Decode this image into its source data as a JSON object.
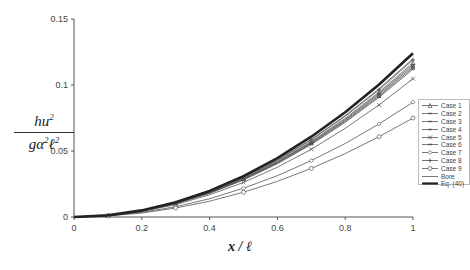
{
  "chart_data": {
    "type": "line",
    "title": "",
    "xlabel": "x / ℓ",
    "ylabel": "hu² / gα²ℓ²",
    "xlim": [
      0,
      1
    ],
    "ylim": [
      0,
      0.15
    ],
    "x_ticks": [
      "0",
      "0.2",
      "0.4",
      "0.6",
      "0.8",
      "1"
    ],
    "y_ticks": [
      "0",
      "0.05",
      "0.1",
      "0.15"
    ],
    "grid": false,
    "legend_position": "right",
    "x": [
      0,
      0.1,
      0.2,
      0.3,
      0.4,
      0.5,
      0.6,
      0.7,
      0.8,
      0.9,
      1.0
    ],
    "series": [
      {
        "name": "Case 1",
        "marker": "triangle",
        "values": [
          0,
          0.0012,
          0.0047,
          0.0105,
          0.0187,
          0.0292,
          0.042,
          0.0572,
          0.0747,
          0.0946,
          0.1168
        ]
      },
      {
        "name": "Case 2",
        "marker": "dash",
        "values": [
          0,
          0.0012,
          0.0046,
          0.0104,
          0.0185,
          0.0289,
          0.0416,
          0.0566,
          0.0739,
          0.0936,
          0.1155
        ]
      },
      {
        "name": "Case 3",
        "marker": "dash",
        "values": [
          0,
          0.0011,
          0.0046,
          0.0103,
          0.0183,
          0.0286,
          0.0412,
          0.056,
          0.0732,
          0.0926,
          0.1143
        ]
      },
      {
        "name": "Case 4",
        "marker": "dash",
        "values": [
          0,
          0.0011,
          0.0045,
          0.0102,
          0.0181,
          0.0283,
          0.0408,
          0.0555,
          0.0725,
          0.0917,
          0.1132
        ]
      },
      {
        "name": "Case 5",
        "marker": "x",
        "values": [
          0,
          0.001,
          0.0042,
          0.0094,
          0.0168,
          0.0262,
          0.0377,
          0.0513,
          0.0671,
          0.0849,
          0.1048
        ]
      },
      {
        "name": "Case 6",
        "marker": "dash",
        "values": [
          0,
          0.0011,
          0.0045,
          0.0101,
          0.0179,
          0.028,
          0.0403,
          0.0549,
          0.0717,
          0.0907,
          0.112
        ]
      },
      {
        "name": "Case 7",
        "marker": "diamond",
        "values": [
          0,
          0.0009,
          0.0035,
          0.0078,
          0.0139,
          0.0218,
          0.0313,
          0.0427,
          0.0557,
          0.0705,
          0.087
        ]
      },
      {
        "name": "Case 8",
        "marker": "plus",
        "values": [
          0,
          0.0012,
          0.0048,
          0.0107,
          0.019,
          0.0297,
          0.0428,
          0.0583,
          0.0762,
          0.0964,
          0.119
        ]
      },
      {
        "name": "Case 9",
        "marker": "circle",
        "values": [
          0,
          0.0008,
          0.003,
          0.0068,
          0.012,
          0.0188,
          0.027,
          0.0368,
          0.048,
          0.0608,
          0.075
        ]
      },
      {
        "name": "Bore",
        "marker": "none",
        "values": [
          0,
          0.0012,
          0.0048,
          0.0108,
          0.0192,
          0.03,
          0.0432,
          0.0588,
          0.0768,
          0.0972,
          0.12
        ]
      },
      {
        "name": "Eq. (40)",
        "marker": "none",
        "bold": true,
        "values": [
          0,
          0.0012,
          0.005,
          0.0112,
          0.0198,
          0.031,
          0.0446,
          0.0608,
          0.0794,
          0.1004,
          0.124
        ]
      }
    ]
  },
  "axis": {
    "y_ticks": [
      "0",
      "0.05",
      "0.1",
      "0.15"
    ],
    "x_ticks": [
      "0",
      "0.2",
      "0.4",
      "0.6",
      "0.8",
      "1"
    ]
  },
  "labels": {
    "y_num_base": "hu",
    "y_num_exp": "2",
    "y_den_g": "gα",
    "y_den_exp1": "2",
    "y_den_l": "ℓ",
    "y_den_exp2": "2",
    "x_label": "x / ℓ"
  },
  "legend": {
    "items": [
      {
        "label": "Case 1",
        "marker": "triangle"
      },
      {
        "label": "Case 2",
        "marker": "dash"
      },
      {
        "label": "Case 3",
        "marker": "dash"
      },
      {
        "label": "Case 4",
        "marker": "dash"
      },
      {
        "label": "Case 5",
        "marker": "x"
      },
      {
        "label": "Case 6",
        "marker": "dash"
      },
      {
        "label": "Case 7",
        "marker": "diamond"
      },
      {
        "label": "Case 8",
        "marker": "plus"
      },
      {
        "label": "Case 9",
        "marker": "circle"
      },
      {
        "label": "Bore",
        "marker": "none"
      },
      {
        "label": "Eq. (40)",
        "marker": "bold"
      }
    ]
  },
  "colors": {
    "axis": "#555555",
    "series": "#555555",
    "eq40": "#222222",
    "text": "#444444"
  }
}
